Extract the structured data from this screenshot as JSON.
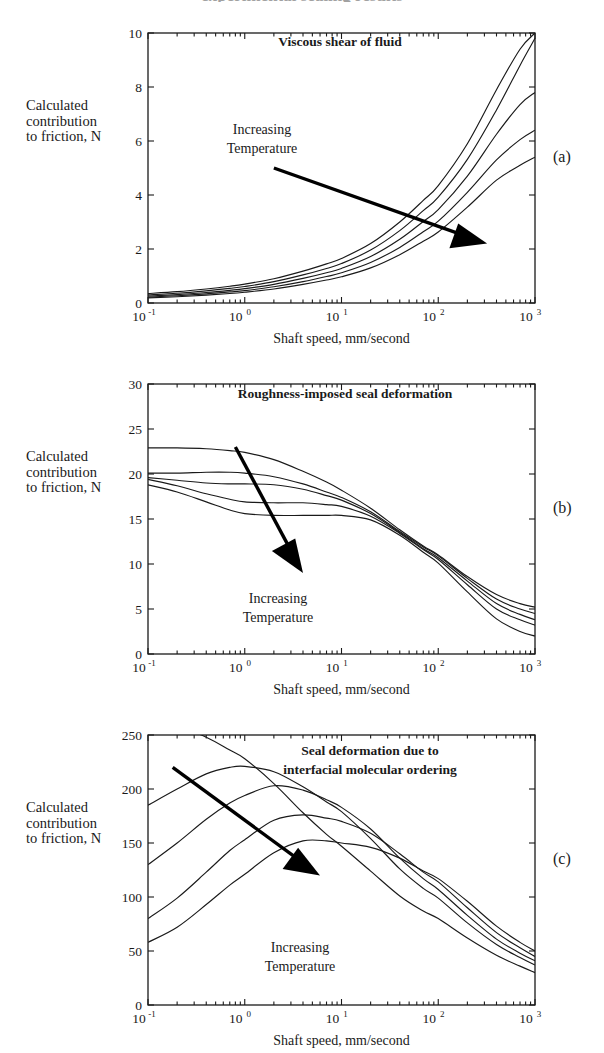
{
  "figure": {
    "cropped_header_text": "experimental sealing results",
    "common_xlabel": "Shaft speed, mm/second",
    "common_ylabel": "Calculated\ncontribution\nto friction, N",
    "annotation": "Increasing\nTemperature",
    "annotation_line1": "Increasing",
    "annotation_line2": "Temperature",
    "panel_letters": [
      "(a)",
      "(b)",
      "(c)"
    ],
    "axis_color": "#1a1a1a",
    "curve_color": "#1a1a1a",
    "arrow_color": "#000000"
  },
  "chart_data": [
    {
      "type": "line",
      "panel": "(a)",
      "title": "Viscous shear of fluid",
      "xlabel": "Shaft speed, mm/second",
      "ylabel": "Calculated contribution to friction, N",
      "xscale": "log",
      "xlim": [
        0.1,
        1000
      ],
      "ylim": [
        0,
        10
      ],
      "yticks": [
        0,
        2,
        4,
        6,
        8,
        10
      ],
      "xticks": [
        0.1,
        1,
        10,
        100,
        1000
      ],
      "xticklabels": [
        "10^-1",
        "10^0",
        "10^1",
        "10^2",
        "10^3"
      ],
      "grid": false,
      "legend": "none",
      "annotation": "Increasing Temperature",
      "x": [
        0.1,
        0.2,
        0.4,
        0.7,
        1,
        2,
        4,
        7,
        10,
        20,
        40,
        70,
        100,
        200,
        400,
        700,
        1000
      ],
      "series": [
        {
          "name": "T1 (lowest temperature)",
          "values": [
            0.35,
            0.42,
            0.52,
            0.62,
            0.7,
            0.9,
            1.18,
            1.45,
            1.65,
            2.2,
            3.0,
            3.8,
            4.35,
            5.9,
            7.9,
            9.4,
            10.0
          ]
        },
        {
          "name": "T2",
          "values": [
            0.3,
            0.36,
            0.45,
            0.54,
            0.61,
            0.79,
            1.04,
            1.28,
            1.46,
            1.96,
            2.68,
            3.42,
            3.92,
            5.32,
            7.15,
            8.8,
            9.8
          ]
        },
        {
          "name": "T3",
          "values": [
            0.26,
            0.31,
            0.39,
            0.47,
            0.53,
            0.69,
            0.91,
            1.12,
            1.28,
            1.72,
            2.36,
            3.02,
            3.46,
            4.7,
            6.25,
            7.35,
            7.8
          ]
        },
        {
          "name": "T4",
          "values": [
            0.22,
            0.27,
            0.34,
            0.41,
            0.46,
            0.6,
            0.79,
            0.98,
            1.12,
            1.5,
            2.06,
            2.64,
            3.03,
            4.1,
            5.3,
            6.05,
            6.4
          ]
        },
        {
          "name": "T5 (highest temperature)",
          "values": [
            0.19,
            0.23,
            0.29,
            0.35,
            0.4,
            0.52,
            0.69,
            0.85,
            0.97,
            1.3,
            1.79,
            2.29,
            2.63,
            3.55,
            4.55,
            5.1,
            5.4
          ]
        }
      ],
      "arrow": {
        "from": [
          2.0,
          5.0
        ],
        "to": [
          320,
          2.2
        ],
        "label": "Increasing Temperature"
      }
    },
    {
      "type": "line",
      "panel": "(b)",
      "title": "Roughness-imposed seal  deformation",
      "xlabel": "Shaft speed, mm/second",
      "ylabel": "Calculated contribution to friction, N",
      "xscale": "log",
      "xlim": [
        0.1,
        1000
      ],
      "ylim": [
        0,
        30
      ],
      "yticks": [
        0,
        5,
        10,
        15,
        20,
        25,
        30
      ],
      "xticks": [
        0.1,
        1,
        10,
        100,
        1000
      ],
      "xticklabels": [
        "10^-1",
        "10^0",
        "10^1",
        "10^2",
        "10^3"
      ],
      "grid": false,
      "legend": "none",
      "annotation": "Increasing Temperature",
      "x": [
        0.1,
        0.2,
        0.4,
        0.7,
        1,
        2,
        4,
        7,
        10,
        20,
        40,
        70,
        100,
        200,
        400,
        700,
        1000
      ],
      "series": [
        {
          "name": "T1 (lowest temperature)",
          "values": [
            22.9,
            22.9,
            22.8,
            22.6,
            22.4,
            21.6,
            20.3,
            19.1,
            18.2,
            16.2,
            13.8,
            12.0,
            11.0,
            8.6,
            6.6,
            5.6,
            5.2
          ]
        },
        {
          "name": "T2",
          "values": [
            20.1,
            20.1,
            20.2,
            20.2,
            20.1,
            19.7,
            18.9,
            18.0,
            17.4,
            15.8,
            13.6,
            11.9,
            10.9,
            8.4,
            6.1,
            5.0,
            4.5
          ]
        },
        {
          "name": "T3",
          "values": [
            19.6,
            19.3,
            19.0,
            18.9,
            18.9,
            18.8,
            18.3,
            17.6,
            17.1,
            15.6,
            13.5,
            11.7,
            10.7,
            8.1,
            5.6,
            4.4,
            3.8
          ]
        },
        {
          "name": "T4",
          "values": [
            19.4,
            18.7,
            17.8,
            17.2,
            16.9,
            16.8,
            16.8,
            16.6,
            16.4,
            15.3,
            13.4,
            11.6,
            10.5,
            7.7,
            5.0,
            3.8,
            3.2
          ]
        },
        {
          "name": "T5 (highest temperature)",
          "values": [
            18.8,
            18.0,
            16.9,
            16.0,
            15.6,
            15.4,
            15.4,
            15.4,
            15.4,
            14.9,
            13.2,
            11.3,
            10.1,
            6.9,
            3.9,
            2.5,
            2.0
          ]
        }
      ],
      "arrow": {
        "from": [
          0.8,
          23.0
        ],
        "to": [
          4.0,
          9.0
        ],
        "label": "Increasing Temperature"
      }
    },
    {
      "type": "line",
      "panel": "(c)",
      "title": "Seal deformation due to\ninterfacial molecular ordering",
      "title_line1": "Seal deformation due to",
      "title_line2": "interfacial molecular ordering",
      "xlabel": "Shaft speed, mm/second",
      "ylabel": "Calculated contribution to friction, N",
      "xscale": "log",
      "xlim": [
        0.1,
        1000
      ],
      "ylim": [
        0,
        250
      ],
      "yticks": [
        0,
        50,
        100,
        150,
        200,
        250
      ],
      "xticks": [
        0.1,
        1,
        10,
        100,
        1000
      ],
      "xticklabels": [
        "10^-1",
        "10^0",
        "10^1",
        "10^2",
        "10^3"
      ],
      "grid": false,
      "legend": "none",
      "annotation": "Increasing Temperature",
      "x": [
        0.1,
        0.2,
        0.4,
        0.7,
        1,
        2,
        4,
        7,
        10,
        20,
        40,
        70,
        100,
        200,
        400,
        700,
        1000
      ],
      "series": [
        {
          "name": "T1 (lowest temperature)",
          "values": [
            262,
            258,
            248,
            236,
            228,
            205,
            178,
            158,
            147,
            124,
            101,
            87,
            80,
            62,
            46,
            36,
            30
          ]
        },
        {
          "name": "T2",
          "values": [
            185,
            200,
            214,
            220,
            221,
            216,
            202,
            188,
            179,
            154,
            126,
            108,
            99,
            76,
            56,
            44,
            37
          ]
        },
        {
          "name": "T3",
          "values": [
            130,
            150,
            172,
            187,
            194,
            203,
            199,
            190,
            183,
            163,
            136,
            117,
            107,
            83,
            61,
            48,
            41
          ]
        },
        {
          "name": "T4",
          "values": [
            80,
            99,
            123,
            143,
            153,
            171,
            176,
            173,
            170,
            159,
            140,
            123,
            114,
            90,
            67,
            53,
            45
          ]
        },
        {
          "name": "T5 (highest temperature)",
          "values": [
            58,
            72,
            93,
            111,
            121,
            141,
            152,
            152,
            150,
            146,
            136,
            124,
            117,
            96,
            73,
            58,
            50
          ]
        }
      ],
      "arrow": {
        "from": [
          0.18,
          220
        ],
        "to": [
          6.0,
          120
        ],
        "label": "Increasing Temperature"
      }
    }
  ]
}
